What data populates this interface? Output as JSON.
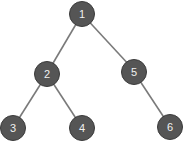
{
  "diagram": {
    "type": "binary-tree",
    "colors": {
      "node_fill": "#555555",
      "node_stroke": "#3a3a3a",
      "node_text": "#f0f0f0",
      "edge": "#7a7a7a",
      "background": "#ffffff"
    },
    "nodes": [
      {
        "id": "1",
        "label": "1",
        "x": 82,
        "y": 14
      },
      {
        "id": "2",
        "label": "2",
        "x": 47,
        "y": 74
      },
      {
        "id": "5",
        "label": "5",
        "x": 134,
        "y": 72
      },
      {
        "id": "3",
        "label": "3",
        "x": 13,
        "y": 128
      },
      {
        "id": "4",
        "label": "4",
        "x": 82,
        "y": 128
      },
      {
        "id": "6",
        "label": "6",
        "x": 170,
        "y": 127
      }
    ],
    "edges": [
      {
        "from": "1",
        "to": "2"
      },
      {
        "from": "1",
        "to": "5"
      },
      {
        "from": "2",
        "to": "3"
      },
      {
        "from": "2",
        "to": "4"
      },
      {
        "from": "5",
        "to": "6"
      }
    ]
  }
}
